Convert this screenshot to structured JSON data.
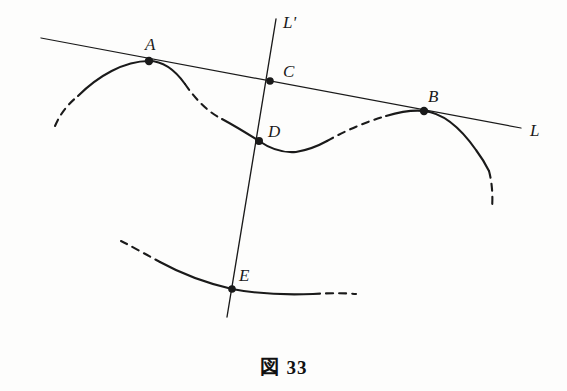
{
  "figure": {
    "caption_symbol": "図",
    "caption_number": "33",
    "background_color": "#fdfdfc",
    "ink_color": "#1a1a1a",
    "width": 567,
    "height": 391
  },
  "lines": [
    {
      "id": "L",
      "label": "L",
      "label_x": 530,
      "label_y": 122,
      "x1": 41,
      "y1": 38,
      "x2": 521,
      "y2": 128,
      "style": "solid",
      "description": "common tangent line through A, C and B"
    },
    {
      "id": "Lprime",
      "label": "L'",
      "label_x": 283,
      "label_y": 14,
      "x1": 276,
      "y1": 19,
      "x2": 227,
      "y2": 317,
      "style": "solid",
      "description": "transversal line through C, D and E"
    }
  ],
  "points": [
    {
      "id": "A",
      "label": "A",
      "x": 149,
      "y": 61,
      "label_x": 145,
      "label_y": 36,
      "marker": "filled-dot"
    },
    {
      "id": "C",
      "label": "C",
      "x": 270,
      "y": 81,
      "label_x": 283,
      "label_y": 63,
      "marker": "filled-dot"
    },
    {
      "id": "B",
      "label": "B",
      "x": 424,
      "y": 111,
      "label_x": 428,
      "label_y": 88,
      "marker": "filled-dot"
    },
    {
      "id": "D",
      "label": "D",
      "x": 259,
      "y": 141,
      "label_x": 268,
      "label_y": 123,
      "marker": "filled-dot"
    },
    {
      "id": "E",
      "label": "E",
      "x": 232,
      "y": 289,
      "label_x": 239,
      "label_y": 267,
      "marker": "filled-dot"
    }
  ],
  "curves": [
    {
      "id": "upper-curve",
      "description": "wavy curve with maximum at A, minimum near D-trough and maximum at B",
      "segments": [
        {
          "style": "dashed",
          "path": "M 55 126 C 60 114, 68 104, 78 96"
        },
        {
          "style": "solid",
          "path": "M 78 96 C 98 76, 124 61, 149 61 C 164 61, 175 70, 185 84"
        },
        {
          "style": "dashed",
          "path": "M 185 84 C 196 100, 208 112, 222 119"
        },
        {
          "style": "solid",
          "path": "M 222 119 C 235 126, 248 134, 259 141 C 272 150, 284 153, 296 152 C 308 150, 318 146, 327 141"
        },
        {
          "style": "dashed",
          "path": "M 327 141 C 345 131, 365 122, 386 116"
        },
        {
          "style": "solid",
          "path": "M 386 116 C 403 111, 416 110, 424 111 C 444 113, 462 130, 476 150 C 482 158, 486 165, 489 171"
        },
        {
          "style": "dashed",
          "path": "M 489 171 C 492 182, 493 196, 492 208"
        }
      ]
    },
    {
      "id": "lower-curve",
      "description": "shallow curve passing through E, concave upward then flattening right",
      "segments": [
        {
          "style": "dashed",
          "path": "M 121 241 C 133 247, 147 255, 160 262"
        },
        {
          "style": "solid",
          "path": "M 160 262 C 180 273, 206 283, 232 289 C 258 294, 288 295, 313 294"
        },
        {
          "style": "dashed",
          "path": "M 313 294 C 330 293, 346 293, 356 294"
        }
      ]
    }
  ]
}
